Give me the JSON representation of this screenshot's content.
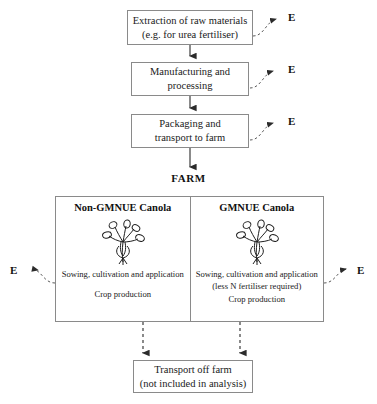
{
  "diagram": {
    "title_label": "FARM",
    "flow_boxes": [
      {
        "id": "extraction",
        "line1": "Extraction of raw materials",
        "line2": "(e.g. for urea fertiliser)"
      },
      {
        "id": "manufacturing",
        "line1": "Manufacturing and",
        "line2": "processing"
      },
      {
        "id": "packaging",
        "line1": "Packaging and",
        "line2": "transport to farm"
      }
    ],
    "energy_labels": {
      "extraction": "E",
      "manufacturing": "E",
      "packaging": "E",
      "farm_left": "E",
      "farm_right": "E"
    },
    "farm": {
      "panels": [
        {
          "id": "non-gmnue",
          "title": "Non-GMNUE Canola",
          "icon": "canola-plant-icon",
          "lines": [
            "Sowing, cultivation and application",
            "",
            "Crop production"
          ]
        },
        {
          "id": "gmnue",
          "title": "GMNUE Canola",
          "icon": "canola-plant-icon",
          "lines": [
            "Sowing, cultivation and application",
            "(less N fertiliser required)",
            "Crop production"
          ]
        }
      ]
    },
    "output_box": {
      "line1": "Transport off farm",
      "line2": "(not included in analysis)"
    },
    "colors": {
      "border": "#8a8a8a",
      "text": "#1a1a1a",
      "connector": "#2b2b2b",
      "background": "#ffffff"
    }
  }
}
